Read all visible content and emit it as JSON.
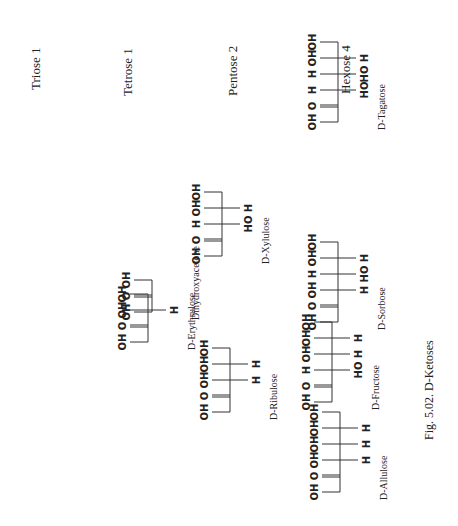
{
  "headings": [
    {
      "label": "Triose  1"
    },
    {
      "label": "Tetrose  1"
    },
    {
      "label": "Pentose  2"
    },
    {
      "label": "Hexose  4"
    }
  ],
  "caption": "Fig. 5.02.  D-Ketoses",
  "structures": [
    {
      "name": "Dihydroxyacetone",
      "group": "Triose",
      "right": [
        "OH",
        "O",
        "OH"
      ],
      "left": [
        "",
        "",
        ""
      ]
    },
    {
      "name": "D-Erythrulose",
      "group": "Tetrose",
      "right": [
        "OH",
        "O",
        "OH",
        "OH"
      ],
      "left": [
        "",
        "",
        "H",
        ""
      ]
    },
    {
      "name": "D-Ribulose",
      "group": "Pentose",
      "right": [
        "OH",
        "O",
        "OH",
        "OH",
        "OH"
      ],
      "left": [
        "",
        "",
        "H",
        "H",
        ""
      ]
    },
    {
      "name": "D-Xylulose",
      "group": "Pentose",
      "right": [
        "OH",
        "O",
        "H",
        "OH",
        "OH"
      ],
      "left": [
        "",
        "",
        "HO",
        "H",
        ""
      ]
    },
    {
      "name": "D-Allulose",
      "group": "Hexose",
      "right": [
        "OH",
        "O",
        "OH",
        "OH",
        "OH",
        "OH"
      ],
      "left": [
        "",
        "",
        "H",
        "H",
        "H",
        ""
      ]
    },
    {
      "name": "D-Fructose",
      "group": "Hexose",
      "right": [
        "OH",
        "O",
        "H",
        "OH",
        "OH",
        "OH"
      ],
      "left": [
        "",
        "",
        "HO",
        "H",
        "H",
        ""
      ]
    },
    {
      "name": "D-Sorbose",
      "group": "Hexose",
      "right": [
        "OH",
        "O",
        "OH",
        "H",
        "OH",
        "OH"
      ],
      "left": [
        "",
        "",
        "H",
        "HO",
        "H",
        ""
      ]
    },
    {
      "name": "D-Tagatose",
      "group": "Hexose",
      "right": [
        "OH",
        "O",
        "H",
        "H",
        "OH",
        "OH"
      ],
      "left": [
        "",
        "",
        "HO",
        "HO",
        "H",
        ""
      ]
    }
  ]
}
